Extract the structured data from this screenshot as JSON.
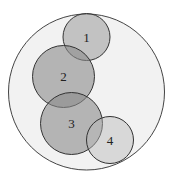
{
  "diagram": {
    "type": "nested-circles",
    "outer": {
      "cx": 86.5,
      "cy": 92,
      "r": 78,
      "fill": "#f2f2f2",
      "stroke": "#444444"
    },
    "circles": [
      {
        "label": "1",
        "cx": 86.5,
        "cy": 37,
        "r": 23.5,
        "fill": "#9a9a9a",
        "opacity": 0.55
      },
      {
        "label": "2",
        "cx": 63.5,
        "cy": 76.5,
        "r": 31,
        "fill": "#8a8a8a",
        "opacity": 0.6
      },
      {
        "label": "3",
        "cx": 71.5,
        "cy": 123.5,
        "r": 31,
        "fill": "#8a8a8a",
        "opacity": 0.6
      },
      {
        "label": "4",
        "cx": 110,
        "cy": 140,
        "r": 23.5,
        "fill": "#b8b8b8",
        "opacity": 0.45
      }
    ]
  }
}
